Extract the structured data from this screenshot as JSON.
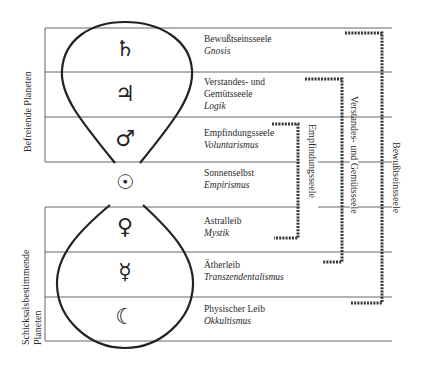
{
  "diagram": {
    "left_labels": {
      "upper": "Befreiende Planeten",
      "lower_line1": "Schicksalsbestimmende",
      "lower_line2": "Planeten"
    },
    "rows": [
      {
        "symbol": "♄",
        "planet": "saturn",
        "title": "Bewußtseinsseele",
        "subtitle": "Gnosis"
      },
      {
        "symbol": "♃",
        "planet": "jupiter",
        "title": "Verstandes- und",
        "title2": "Gemütsseele",
        "subtitle": "Logik"
      },
      {
        "symbol": "♂",
        "planet": "mars",
        "title": "Empfindungsseele",
        "subtitle": "Voluntarismus"
      },
      {
        "symbol": "☉",
        "planet": "sun",
        "title": "Sonnenselbst",
        "subtitle": "Empirismus"
      },
      {
        "symbol": "♀",
        "planet": "venus",
        "title": "Astralleib",
        "subtitle": "Mystik"
      },
      {
        "symbol": "☿",
        "planet": "mercury",
        "title": "Ätherleib",
        "subtitle": "Transzendentalismus"
      },
      {
        "symbol": "☾",
        "planet": "moon",
        "title": "Physischer Leib",
        "subtitle": "Okkultismus"
      }
    ],
    "brackets": [
      {
        "label": "Empfindungsseele"
      },
      {
        "label": "Verstandes- und Gemütsseele"
      },
      {
        "label": "Bewußtseinsseele"
      }
    ]
  }
}
